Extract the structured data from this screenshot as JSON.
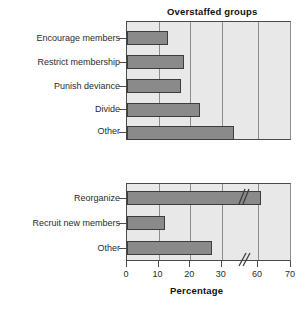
{
  "chart_data": {
    "type": "bar",
    "orientation": "horizontal",
    "title": "",
    "xlabel": "Percentage",
    "ylabel": "",
    "xlim": [
      0,
      70
    ],
    "axis_break": {
      "present": true,
      "from": 35,
      "to": 55,
      "label": "//"
    },
    "xticks": [
      0,
      10,
      20,
      30,
      60,
      70
    ],
    "xticklabels": [
      "0",
      "10",
      "20",
      "30",
      "60",
      "70"
    ],
    "grid": "vertical",
    "legend": "none",
    "panels": [
      {
        "title": "Overstaffed groups",
        "categories": [
          "Encourage members",
          "Restrict membership",
          "Punish deviance",
          "Divide",
          "Other"
        ],
        "values": [
          13,
          18,
          17,
          23,
          34
        ]
      },
      {
        "title": "Understaffed groups",
        "categories": [
          "Reorganize",
          "Recruit new members",
          "Other"
        ],
        "values": [
          61,
          12,
          27
        ]
      }
    ],
    "colors": {
      "bar_fill": "#8a8a8a",
      "bar_edge": "#3d3d3d",
      "plot_background": "#e8e8e8",
      "gridline": "#8c8c8c",
      "axis": "#4a4a4a",
      "text": "#1a1a1a"
    }
  }
}
